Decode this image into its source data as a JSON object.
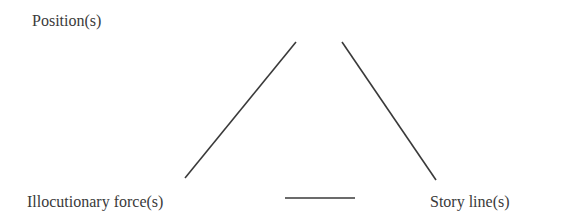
{
  "diagram": {
    "type": "triangle",
    "nodes": [
      {
        "id": "position",
        "label": "Position(s)"
      },
      {
        "id": "illocutionary_force",
        "label": "Illocutionary force(s)"
      },
      {
        "id": "story_line",
        "label": "Story line(s)"
      }
    ],
    "edges": [
      {
        "from": "position",
        "to": "illocutionary_force"
      },
      {
        "from": "position",
        "to": "story_line"
      },
      {
        "from": "illocutionary_force",
        "to": "story_line"
      }
    ],
    "line_color": "#3a3a3a",
    "text_color": "#3a3a3a"
  }
}
